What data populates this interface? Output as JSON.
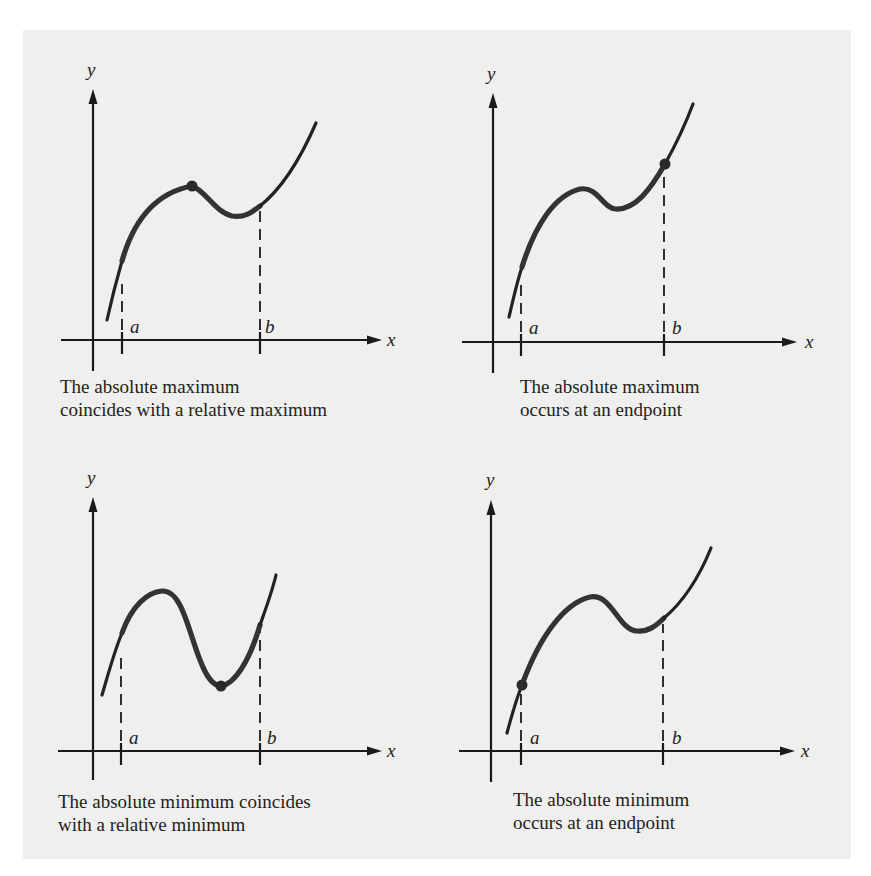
{
  "figure": {
    "panels": [
      {
        "id": "abs-max-relative-max",
        "caption_line1": "The absolute maximum",
        "caption_line2": "coincides with a relative maximum",
        "x_label": "x",
        "y_label": "y",
        "a_label": "a",
        "b_label": "b",
        "marked_point": "relative maximum (interior)"
      },
      {
        "id": "abs-max-endpoint",
        "caption_line1": "The absolute maximum",
        "caption_line2": "occurs at an endpoint",
        "x_label": "x",
        "y_label": "y",
        "a_label": "a",
        "b_label": "b",
        "marked_point": "endpoint b"
      },
      {
        "id": "abs-min-relative-min",
        "caption_line1": "The absolute minimum coincides",
        "caption_line2": "with a relative minimum",
        "x_label": "x",
        "y_label": "y",
        "a_label": "a",
        "b_label": "b",
        "marked_point": "relative minimum (interior)"
      },
      {
        "id": "abs-min-endpoint",
        "caption_line1": "The absolute minimum",
        "caption_line2": "occurs at an endpoint",
        "x_label": "x",
        "y_label": "y",
        "a_label": "a",
        "b_label": "b",
        "marked_point": "endpoint a"
      }
    ],
    "colors": {
      "panel_background": "#efefed",
      "page_background": "#ffffff",
      "ink": "#1a1a1a"
    }
  }
}
